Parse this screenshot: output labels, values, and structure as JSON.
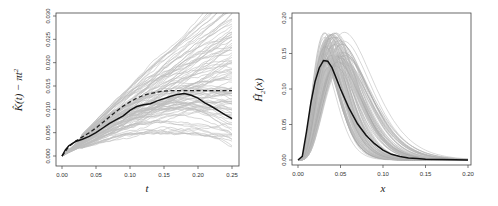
{
  "chart_data": [
    {
      "type": "line",
      "title": "",
      "xlabel": "t",
      "ylabel": "K̂(t) − πt²",
      "xlim": [
        0,
        0.25
      ],
      "ylim": [
        0,
        0.03
      ],
      "xticks": [
        "0.00",
        "0.05",
        "0.10",
        "0.15",
        "0.20",
        "0.25"
      ],
      "yticks": [
        "0.000",
        "0.005",
        "0.010",
        "0.015",
        "0.020",
        "0.025",
        "0.030"
      ],
      "grid": false,
      "series": [
        {
          "name": "observed",
          "style": "solid-black",
          "x": [
            0.0,
            0.005,
            0.01,
            0.02,
            0.03,
            0.04,
            0.05,
            0.06,
            0.07,
            0.08,
            0.09,
            0.1,
            0.11,
            0.12,
            0.13,
            0.14,
            0.15,
            0.16,
            0.17,
            0.18,
            0.19,
            0.2,
            0.21,
            0.22,
            0.23,
            0.24,
            0.25
          ],
          "values": [
            0.0,
            0.0013,
            0.0022,
            0.0031,
            0.0036,
            0.0042,
            0.005,
            0.006,
            0.007,
            0.0078,
            0.0086,
            0.0098,
            0.0106,
            0.011,
            0.0112,
            0.0118,
            0.0123,
            0.0128,
            0.0132,
            0.0134,
            0.013,
            0.0124,
            0.0114,
            0.0106,
            0.0097,
            0.0088,
            0.008
          ]
        },
        {
          "name": "theoretical",
          "style": "dashed-black",
          "x": [
            0.0,
            0.01,
            0.02,
            0.03,
            0.04,
            0.05,
            0.06,
            0.07,
            0.08,
            0.09,
            0.1,
            0.11,
            0.12,
            0.13,
            0.14,
            0.15,
            0.16,
            0.18,
            0.2,
            0.25
          ],
          "values": [
            0.0,
            0.002,
            0.0032,
            0.0041,
            0.005,
            0.006,
            0.0072,
            0.0084,
            0.0096,
            0.0107,
            0.0116,
            0.0124,
            0.013,
            0.0134,
            0.0137,
            0.0139,
            0.014,
            0.014,
            0.014,
            0.014
          ]
        },
        {
          "name": "simulations",
          "style": "gray-envelope",
          "count": 100,
          "spread_at_end": [
            0.0,
            0.03
          ]
        }
      ]
    },
    {
      "type": "line",
      "title": "",
      "xlabel": "x",
      "ylabel": "Ĥ₂(x)",
      "xlim": [
        0,
        0.2
      ],
      "ylim": [
        0,
        0.2
      ],
      "xticks": [
        "0.00",
        "0.05",
        "0.10",
        "0.15",
        "0.20"
      ],
      "yticks": [
        "0.00",
        "0.05",
        "0.10",
        "0.15",
        "0.20"
      ],
      "grid": false,
      "series": [
        {
          "name": "observed",
          "style": "solid-black",
          "x": [
            0.0,
            0.005,
            0.01,
            0.015,
            0.02,
            0.025,
            0.03,
            0.035,
            0.04,
            0.045,
            0.05,
            0.06,
            0.07,
            0.08,
            0.09,
            0.1,
            0.11,
            0.12,
            0.13,
            0.14,
            0.15,
            0.17,
            0.2
          ],
          "values": [
            0.0,
            0.005,
            0.04,
            0.08,
            0.11,
            0.13,
            0.14,
            0.139,
            0.13,
            0.115,
            0.1,
            0.073,
            0.051,
            0.035,
            0.023,
            0.014,
            0.008,
            0.005,
            0.003,
            0.002,
            0.001,
            0.0005,
            0.0
          ]
        },
        {
          "name": "simulations",
          "style": "gray-envelope",
          "count": 100,
          "peak_range": [
            0.13,
            0.18
          ],
          "peak_x_range": [
            0.03,
            0.055
          ]
        }
      ]
    }
  ],
  "plots": {
    "left": {
      "xlabel": "t",
      "ylabel_main": "K̂(t) − πt",
      "ylabel_sup": "2"
    },
    "right": {
      "xlabel": "x",
      "ylabel_main": "Ĥ",
      "ylabel_sub": "2",
      "ylabel_tail": "(x)"
    }
  },
  "colors": {
    "observed": "#111111",
    "simulation": "#bdbdbd",
    "simulation_dark": "#a8a8a8",
    "frame": "#444444"
  }
}
